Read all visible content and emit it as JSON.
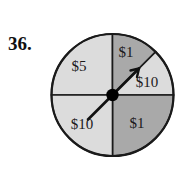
{
  "problem": {
    "number": "36."
  },
  "figure": {
    "name": "spinner-diagram",
    "type": "spinner",
    "center": {
      "x": 112.5,
      "y": 95
    },
    "radius": 61,
    "colors": {
      "light_fill": "#dcdcdc",
      "dark_fill": "#a9a9a9",
      "outline": "#1a1a1a",
      "pointer": "#111111",
      "hub": "#000000",
      "text": "#1a1a1a"
    },
    "pointer": {
      "name": "spinner-pointer",
      "direction_degrees": 45,
      "description": "arrow pointing up and to the right"
    },
    "hub": {
      "name": "spinner-hub",
      "radius": 6
    },
    "sectors": [
      {
        "id": "sector-5-upper-left",
        "label": "$5",
        "start_angle": 90,
        "end_angle": 180,
        "shade": "light",
        "label_x": 79,
        "label_y": 71
      },
      {
        "id": "sector-1-top-right",
        "label": "$1",
        "start_angle": 45,
        "end_angle": 90,
        "shade": "dark",
        "label_x": 126,
        "label_y": 57
      },
      {
        "id": "sector-10-right",
        "label": "$10",
        "start_angle": 0,
        "end_angle": 45,
        "shade": "light",
        "label_x": 142,
        "label_y": 85
      },
      {
        "id": "sector-1-lower-right",
        "label": "$1",
        "start_angle": 270,
        "end_angle": 360,
        "shade": "dark",
        "label_x": 137,
        "label_y": 128
      },
      {
        "id": "sector-10-lower-left",
        "label": "$10",
        "start_angle": 180,
        "end_angle": 270,
        "shade": "light",
        "label_x": 82,
        "label_y": 129
      }
    ]
  }
}
